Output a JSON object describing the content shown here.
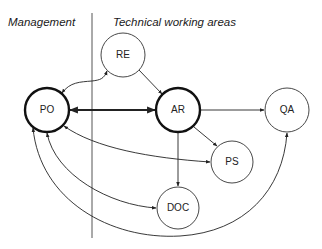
{
  "areas": {
    "management": "Management",
    "technical": "Technical working areas"
  },
  "nodes": [
    {
      "id": "PO",
      "label": "PO",
      "cx": 47,
      "cy": 110,
      "r": 22,
      "emphasis": true,
      "area": "Management"
    },
    {
      "id": "RE",
      "label": "RE",
      "cx": 123,
      "cy": 55,
      "r": 22,
      "emphasis": false,
      "area": "Technical working areas"
    },
    {
      "id": "AR",
      "label": "AR",
      "cx": 178,
      "cy": 110,
      "r": 22,
      "emphasis": true,
      "area": "Technical working areas"
    },
    {
      "id": "QA",
      "label": "QA",
      "cx": 287,
      "cy": 110,
      "r": 22,
      "emphasis": false,
      "area": "Technical working areas"
    },
    {
      "id": "PS",
      "label": "PS",
      "cx": 232,
      "cy": 162,
      "r": 21,
      "emphasis": false,
      "area": "Technical working areas"
    },
    {
      "id": "DOC",
      "label": "DOC",
      "cx": 178,
      "cy": 208,
      "r": 21,
      "emphasis": false,
      "area": "Technical working areas"
    }
  ],
  "edges": [
    {
      "from": "PO",
      "to": "AR",
      "bidirectional": true,
      "emphasis": true
    },
    {
      "from": "PO",
      "to": "RE",
      "bidirectional": true,
      "emphasis": false
    },
    {
      "from": "RE",
      "to": "AR",
      "bidirectional": false,
      "emphasis": false
    },
    {
      "from": "AR",
      "to": "QA",
      "bidirectional": false,
      "emphasis": false
    },
    {
      "from": "AR",
      "to": "PS",
      "bidirectional": false,
      "emphasis": false
    },
    {
      "from": "AR",
      "to": "DOC",
      "bidirectional": false,
      "emphasis": false
    },
    {
      "from": "PO",
      "to": "PS",
      "bidirectional": true,
      "emphasis": false
    },
    {
      "from": "PO",
      "to": "DOC",
      "bidirectional": true,
      "emphasis": false
    },
    {
      "from": "PO",
      "to": "QA",
      "bidirectional": true,
      "emphasis": false
    }
  ],
  "colors": {
    "stroke": "#222222",
    "background": "#ffffff",
    "divider": "#555555"
  }
}
